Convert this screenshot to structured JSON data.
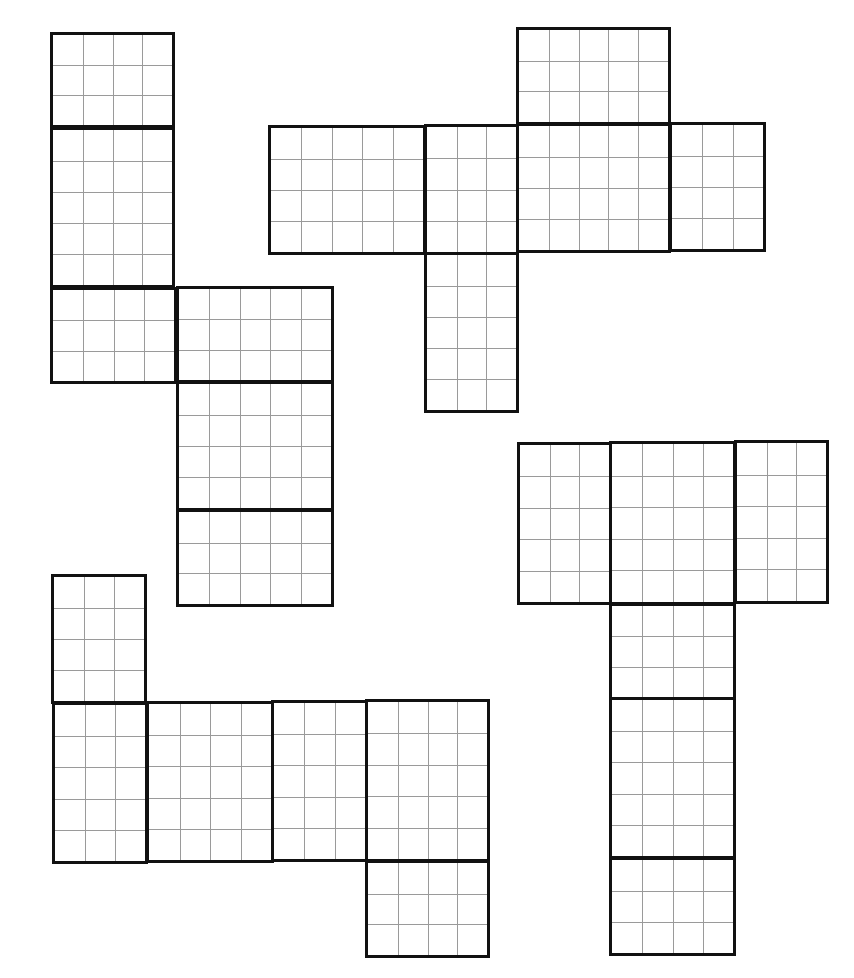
{
  "diagram": {
    "title": "",
    "colors": {
      "background": "#ffffff",
      "outline": "#111111",
      "grid": "#9a9a9a"
    },
    "nets": [
      {
        "id": "net-1",
        "position": "upper-left",
        "panels": [
          {
            "x": 50,
            "y": 32,
            "w": 125,
            "h": 96,
            "cols": 4,
            "rows": 3
          },
          {
            "x": 50,
            "y": 127,
            "w": 125,
            "h": 161,
            "cols": 4,
            "rows": 5
          },
          {
            "x": 50,
            "y": 287,
            "w": 127,
            "h": 97,
            "cols": 4,
            "rows": 3
          },
          {
            "x": 176,
            "y": 286,
            "w": 158,
            "h": 97,
            "cols": 5,
            "rows": 3
          },
          {
            "x": 176,
            "y": 381,
            "w": 158,
            "h": 130,
            "cols": 5,
            "rows": 4
          },
          {
            "x": 176,
            "y": 509,
            "w": 158,
            "h": 98,
            "cols": 5,
            "rows": 3
          }
        ]
      },
      {
        "id": "net-2",
        "position": "upper-right",
        "panels": [
          {
            "x": 516,
            "y": 27,
            "w": 155,
            "h": 98,
            "cols": 5,
            "rows": 3
          },
          {
            "x": 268,
            "y": 125,
            "w": 158,
            "h": 130,
            "cols": 5,
            "rows": 4
          },
          {
            "x": 424,
            "y": 124,
            "w": 95,
            "h": 131,
            "cols": 3,
            "rows": 4
          },
          {
            "x": 516,
            "y": 123,
            "w": 155,
            "h": 130,
            "cols": 5,
            "rows": 4
          },
          {
            "x": 669,
            "y": 122,
            "w": 97,
            "h": 130,
            "cols": 3,
            "rows": 4
          },
          {
            "x": 424,
            "y": 252,
            "w": 95,
            "h": 161,
            "cols": 3,
            "rows": 5
          }
        ]
      },
      {
        "id": "net-3",
        "position": "lower-left",
        "panels": [
          {
            "x": 51,
            "y": 574,
            "w": 96,
            "h": 130,
            "cols": 3,
            "rows": 4
          },
          {
            "x": 52,
            "y": 702,
            "w": 96,
            "h": 162,
            "cols": 3,
            "rows": 5
          },
          {
            "x": 146,
            "y": 701,
            "w": 128,
            "h": 162,
            "cols": 4,
            "rows": 5
          },
          {
            "x": 271,
            "y": 700,
            "w": 97,
            "h": 162,
            "cols": 3,
            "rows": 5
          },
          {
            "x": 365,
            "y": 699,
            "w": 125,
            "h": 163,
            "cols": 4,
            "rows": 5
          },
          {
            "x": 365,
            "y": 860,
            "w": 125,
            "h": 98,
            "cols": 4,
            "rows": 3
          }
        ]
      },
      {
        "id": "net-4",
        "position": "lower-right",
        "panels": [
          {
            "x": 517,
            "y": 442,
            "w": 95,
            "h": 163,
            "cols": 3,
            "rows": 5
          },
          {
            "x": 609,
            "y": 441,
            "w": 127,
            "h": 164,
            "cols": 4,
            "rows": 5
          },
          {
            "x": 734,
            "y": 440,
            "w": 95,
            "h": 164,
            "cols": 3,
            "rows": 5
          },
          {
            "x": 609,
            "y": 603,
            "w": 127,
            "h": 97,
            "cols": 4,
            "rows": 3
          },
          {
            "x": 609,
            "y": 697,
            "w": 127,
            "h": 162,
            "cols": 4,
            "rows": 5
          },
          {
            "x": 609,
            "y": 857,
            "w": 127,
            "h": 99,
            "cols": 4,
            "rows": 3
          }
        ]
      }
    ]
  }
}
